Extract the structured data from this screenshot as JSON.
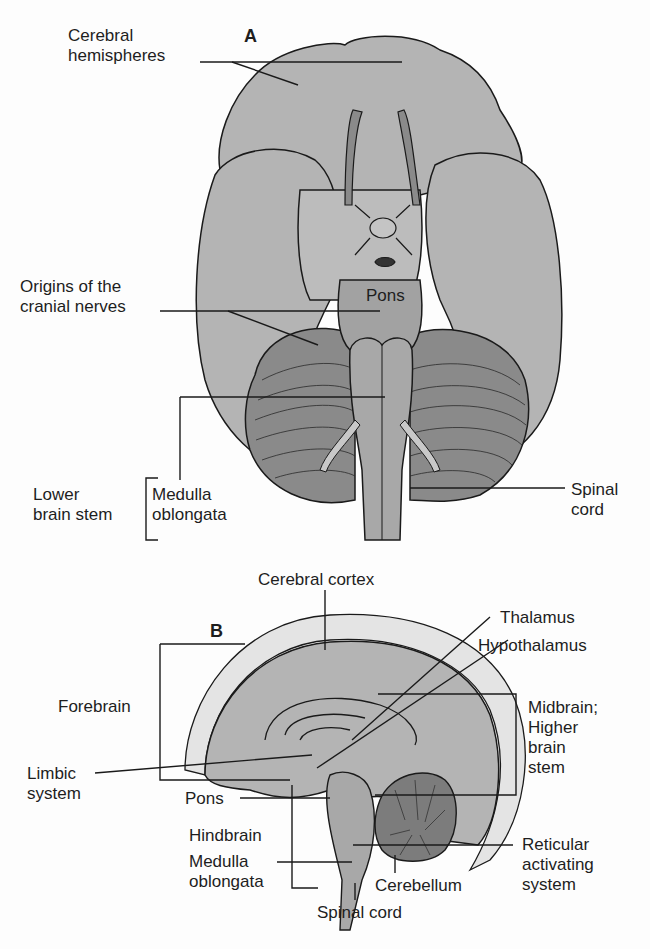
{
  "figure": {
    "panel_a": {
      "letter": "A",
      "view": "inferior view of brain",
      "labels": {
        "cerebral_hemispheres": "Cerebral\nhemispheres",
        "origins_cranial_nerves": "Origins of the\ncranial nerves",
        "pons": "Pons",
        "lower_brain_stem": "Lower\nbrain stem",
        "medulla_oblongata": "Medulla\noblongata",
        "spinal_cord": "Spinal\ncord"
      }
    },
    "panel_b": {
      "letter": "B",
      "view": "midsagittal section of brain",
      "labels": {
        "cerebral_cortex": "Cerebral cortex",
        "thalamus": "Thalamus",
        "hypothalamus": "Hypothalamus",
        "forebrain": "Forebrain",
        "midbrain": "Midbrain;\nHigher\nbrain\nstem",
        "limbic_system": "Limbic\nsystem",
        "pons": "Pons",
        "hindbrain": "Hindbrain",
        "medulla_oblongata": "Medulla\noblongata",
        "reticular_activating_system": "Reticular\nactivating\nsystem",
        "cerebellum": "Cerebellum",
        "spinal_cord": "Spinal cord"
      }
    },
    "colors": {
      "brain_light": "#b4b4b4",
      "brain_dark": "#8a8a8a",
      "stem": "#a2a2a2",
      "outline": "#1a1a1a",
      "background": "#fdfdfd"
    }
  }
}
